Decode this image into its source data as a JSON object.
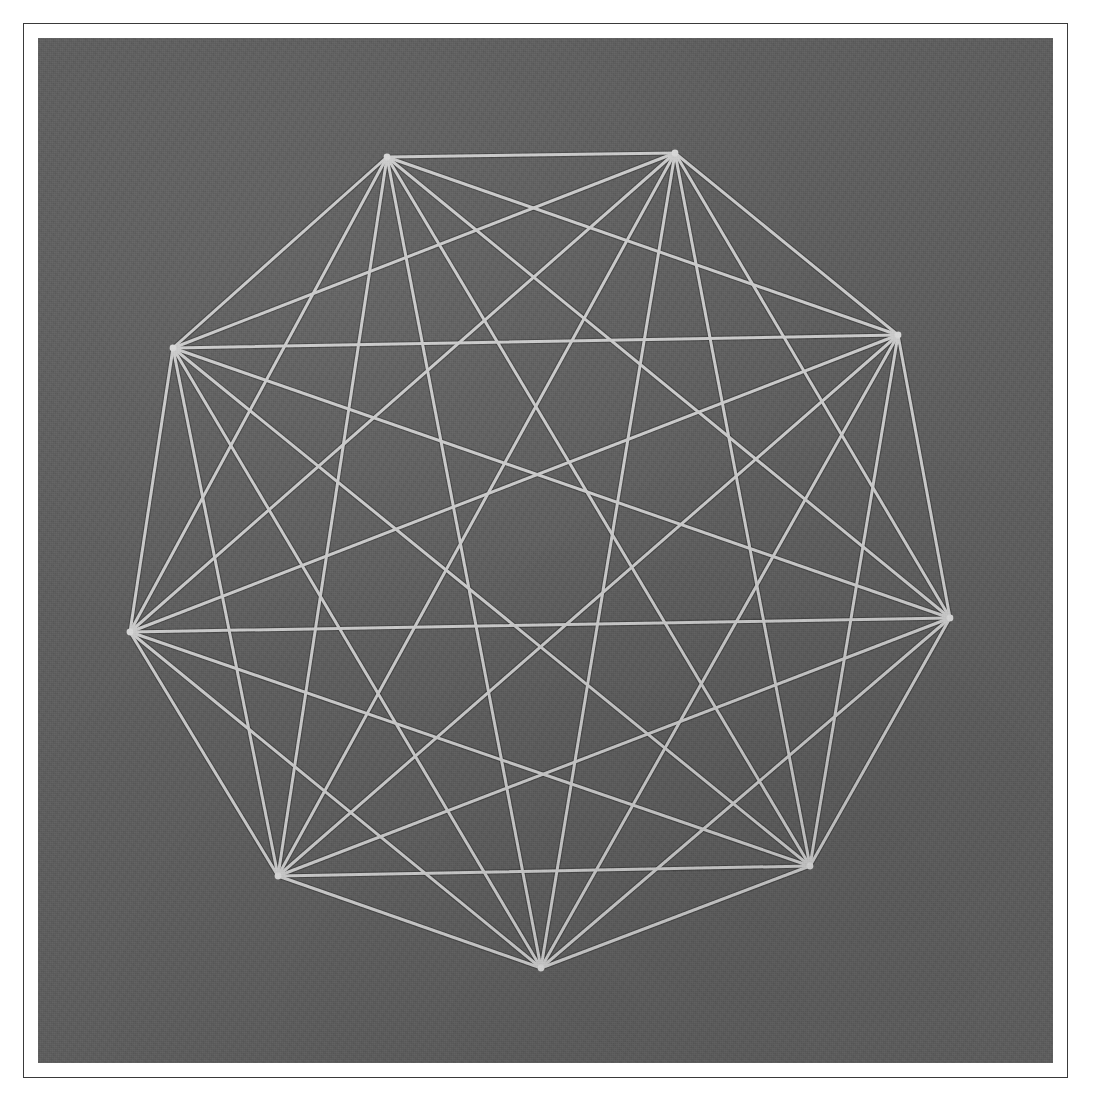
{
  "figure": {
    "plate": {
      "background_color": "#5e5e5e",
      "line_color": "#c9c9c9",
      "frame_color": "#3a3a3a",
      "page_color": "#ffffff",
      "line_width": 3.0,
      "vertex_dot_radius": 3.4,
      "plate_left": 38,
      "plate_top": 38,
      "plate_width": 1015,
      "plate_height": 1025,
      "frame_left": 23,
      "frame_top": 23,
      "frame_width": 1045,
      "frame_height": 1055
    }
  },
  "chart_data": {
    "type": "diagram",
    "subtype": "graph-node-link",
    "xlabel": "",
    "ylabel": "",
    "grid": false,
    "legend": "none",
    "node_count": 9,
    "edge_count": 36,
    "graph_name": "K9",
    "coordinate_space": {
      "note": "coordinates are in plate-local pixels; plate is 1015 x 1025",
      "width": 1015,
      "height": 1025
    },
    "nodes": [
      {
        "id": "v1",
        "label": "1",
        "x": 349,
        "y": 119
      },
      {
        "id": "v2",
        "label": "2",
        "x": 637,
        "y": 115
      },
      {
        "id": "v3",
        "label": "3",
        "x": 860,
        "y": 297
      },
      {
        "id": "v4",
        "label": "4",
        "x": 912,
        "y": 580
      },
      {
        "id": "v5",
        "label": "5",
        "x": 772,
        "y": 828
      },
      {
        "id": "v6",
        "label": "6",
        "x": 503,
        "y": 930
      },
      {
        "id": "v7",
        "label": "7",
        "x": 240,
        "y": 838
      },
      {
        "id": "v8",
        "label": "8",
        "x": 92,
        "y": 594
      },
      {
        "id": "v9",
        "label": "9",
        "x": 135,
        "y": 310
      }
    ],
    "edges": [
      [
        "v1",
        "v2"
      ],
      [
        "v1",
        "v3"
      ],
      [
        "v1",
        "v4"
      ],
      [
        "v1",
        "v5"
      ],
      [
        "v1",
        "v6"
      ],
      [
        "v1",
        "v7"
      ],
      [
        "v1",
        "v8"
      ],
      [
        "v1",
        "v9"
      ],
      [
        "v2",
        "v3"
      ],
      [
        "v2",
        "v4"
      ],
      [
        "v2",
        "v5"
      ],
      [
        "v2",
        "v6"
      ],
      [
        "v2",
        "v7"
      ],
      [
        "v2",
        "v8"
      ],
      [
        "v2",
        "v9"
      ],
      [
        "v3",
        "v4"
      ],
      [
        "v3",
        "v5"
      ],
      [
        "v3",
        "v6"
      ],
      [
        "v3",
        "v7"
      ],
      [
        "v3",
        "v8"
      ],
      [
        "v3",
        "v9"
      ],
      [
        "v4",
        "v5"
      ],
      [
        "v4",
        "v6"
      ],
      [
        "v4",
        "v7"
      ],
      [
        "v4",
        "v8"
      ],
      [
        "v4",
        "v9"
      ],
      [
        "v5",
        "v6"
      ],
      [
        "v5",
        "v7"
      ],
      [
        "v5",
        "v8"
      ],
      [
        "v5",
        "v9"
      ],
      [
        "v6",
        "v7"
      ],
      [
        "v6",
        "v8"
      ],
      [
        "v6",
        "v9"
      ],
      [
        "v7",
        "v8"
      ],
      [
        "v7",
        "v9"
      ],
      [
        "v8",
        "v9"
      ]
    ]
  }
}
